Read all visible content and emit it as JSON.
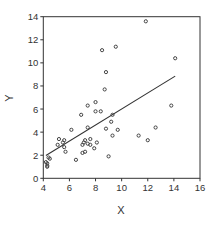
{
  "chart_data": {
    "type": "scatter",
    "title": "",
    "xlabel": "X",
    "ylabel": "Y",
    "xlim": [
      4,
      16
    ],
    "ylim": [
      0,
      14
    ],
    "xticks": [
      4,
      6,
      8,
      10,
      12,
      14,
      16
    ],
    "yticks": [
      0,
      2,
      4,
      6,
      8,
      10,
      12,
      14
    ],
    "grid": false,
    "legend": null,
    "points": [
      [
        11.85,
        13.6
      ],
      [
        14.1,
        10.4
      ],
      [
        8.5,
        11.1
      ],
      [
        9.55,
        11.4
      ],
      [
        8.8,
        9.2
      ],
      [
        8.7,
        7.7
      ],
      [
        8.0,
        6.6
      ],
      [
        8.0,
        5.8
      ],
      [
        7.4,
        6.3
      ],
      [
        8.4,
        5.8
      ],
      [
        6.9,
        5.5
      ],
      [
        9.3,
        5.5
      ],
      [
        13.8,
        6.3
      ],
      [
        9.2,
        4.9
      ],
      [
        7.4,
        4.4
      ],
      [
        8.8,
        4.3
      ],
      [
        9.7,
        4.2
      ],
      [
        6.15,
        4.2
      ],
      [
        12.6,
        4.4
      ],
      [
        9.3,
        3.7
      ],
      [
        11.3,
        3.7
      ],
      [
        12.0,
        3.3
      ],
      [
        5.2,
        3.4
      ],
      [
        5.6,
        3.3
      ],
      [
        5.5,
        3.1
      ],
      [
        5.1,
        2.9
      ],
      [
        5.6,
        2.7
      ],
      [
        5.7,
        2.3
      ],
      [
        7.2,
        3.3
      ],
      [
        7.1,
        3.1
      ],
      [
        7.0,
        2.9
      ],
      [
        7.6,
        3.4
      ],
      [
        7.6,
        2.9
      ],
      [
        7.4,
        3.0
      ],
      [
        8.1,
        3.1
      ],
      [
        7.9,
        2.6
      ],
      [
        7.0,
        2.2
      ],
      [
        7.2,
        2.3
      ],
      [
        9.0,
        1.9
      ],
      [
        6.5,
        1.6
      ],
      [
        4.4,
        1.8
      ],
      [
        4.5,
        1.7
      ],
      [
        4.2,
        1.4
      ],
      [
        4.3,
        1.3
      ],
      [
        4.3,
        1.1
      ],
      [
        4.3,
        1.0
      ]
    ],
    "fit_line": {
      "type": "linear",
      "x0": 4.2,
      "y0": 1.97,
      "x1": 14.1,
      "y1": 8.85
    }
  },
  "colors": {
    "axis": "#333333",
    "point": "#444444",
    "line": "#333333"
  }
}
